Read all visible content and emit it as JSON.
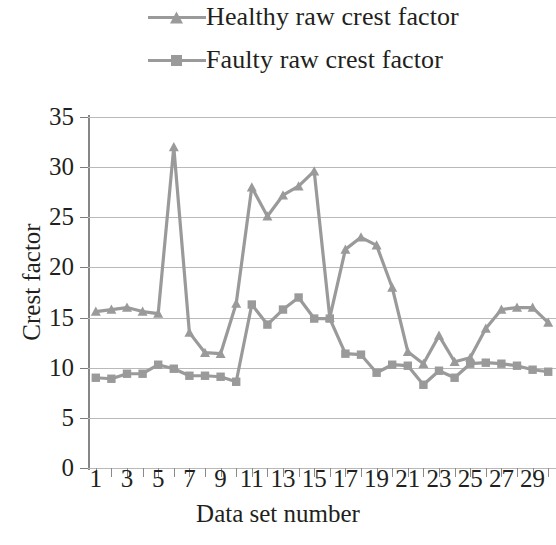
{
  "chart_data": {
    "type": "line",
    "title": "",
    "xlabel": "Data set number",
    "ylabel": "Crest factor",
    "xlim": [
      0.5,
      30.5
    ],
    "ylim": [
      0,
      35
    ],
    "ytick_labels": [
      "35",
      "30",
      "25",
      "20",
      "15",
      "10",
      "5",
      "0"
    ],
    "ytick_values": [
      35,
      30,
      25,
      20,
      15,
      10,
      5,
      0
    ],
    "xtick_labels": [
      "1",
      "3",
      "5",
      "7",
      "9",
      "11",
      "13",
      "15",
      "17",
      "19",
      "21",
      "23",
      "25",
      "27",
      "29"
    ],
    "xtick_values": [
      1,
      3,
      5,
      7,
      9,
      11,
      13,
      15,
      17,
      19,
      21,
      23,
      25,
      27,
      29
    ],
    "x": [
      1,
      2,
      3,
      4,
      5,
      6,
      7,
      8,
      9,
      10,
      11,
      12,
      13,
      14,
      15,
      16,
      17,
      18,
      19,
      20,
      21,
      22,
      23,
      24,
      25,
      26,
      27,
      28,
      29,
      30
    ],
    "grid": true,
    "grid_axis": "y",
    "legend_position": "top",
    "series": [
      {
        "name": "Healthy raw crest factor",
        "marker": "triangle",
        "color": "#9a9a9a",
        "values": [
          15.6,
          15.8,
          16.0,
          15.6,
          15.4,
          32.0,
          13.5,
          11.5,
          11.4,
          16.4,
          28.0,
          25.1,
          27.2,
          28.1,
          29.6,
          15.0,
          21.8,
          23.0,
          22.2,
          18.0,
          11.6,
          10.4,
          13.2,
          10.6,
          11.0,
          13.9,
          15.8,
          16.0,
          16.0,
          14.5
        ]
      },
      {
        "name": "Faulty raw crest factor",
        "marker": "square",
        "color": "#9a9a9a",
        "values": [
          9.0,
          8.9,
          9.4,
          9.4,
          10.3,
          9.9,
          9.2,
          9.2,
          9.1,
          8.6,
          16.3,
          14.3,
          15.8,
          17.0,
          14.9,
          14.9,
          11.4,
          11.3,
          9.5,
          10.3,
          10.2,
          8.3,
          9.7,
          9.0,
          10.4,
          10.5,
          10.4,
          10.2,
          9.8,
          9.6
        ]
      }
    ]
  },
  "legend": {
    "items": [
      {
        "label": "Healthy raw crest factor",
        "marker": "triangle"
      },
      {
        "label": "Faulty raw crest factor",
        "marker": "square"
      }
    ]
  },
  "colors": {
    "series": "#9a9a9a",
    "gridline": "#b9b9b9",
    "axis": "#868686",
    "text": "#231f20",
    "background": "#ffffff"
  }
}
